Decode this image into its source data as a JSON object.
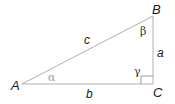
{
  "diagram": {
    "vertices": {
      "A": "A",
      "B": "B",
      "C": "C"
    },
    "sides": {
      "a": "a",
      "b": "b",
      "c": "c"
    },
    "angles": {
      "alpha": "α",
      "beta": "β",
      "gamma": "γ"
    },
    "colors": {
      "line": "#b0b0b0",
      "text": "#1a1a1a",
      "alpha": "#999999"
    }
  }
}
